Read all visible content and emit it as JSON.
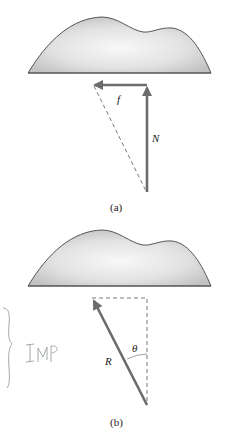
{
  "panels": [
    {
      "id": "a",
      "caption": "(a)",
      "labels": {
        "horizontal_force": "f",
        "vertical_force": "N"
      }
    },
    {
      "id": "b",
      "caption": "(b)",
      "labels": {
        "resultant": "R",
        "angle": "θ"
      }
    }
  ],
  "annotation": {
    "text": "IMP"
  },
  "colors": {
    "arrow": "#6b6b6b",
    "dashed": "#555555",
    "shape_outline": "#555555",
    "shape_fill_light": "#f6f6f6",
    "shape_fill_dark": "#c8c8c8",
    "handwriting": "#9aa29a"
  }
}
